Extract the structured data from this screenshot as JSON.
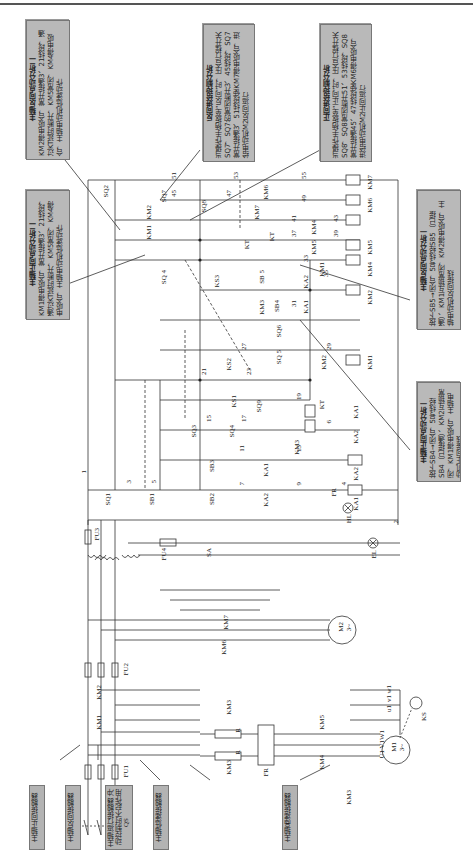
{
  "notes": {
    "n1": {
      "title": "主轴反向点动分析二",
      "body": "KM2得电吸合，常开接通3、21线段，通过KT延时断开，KM5常闭，KM4得电吸合，主轴电动机低速动作"
    },
    "n2": {
      "title": "反向进给控制分析",
      "body": "当操作手柄扳至“反向”时，压合行程开关SQ7，SQ7的常闭断开3、45线段，SQ7常开接通3、51线段使KM7得电吸合，进给电动机M2反向运行"
    },
    "n3": {
      "title": "正向进给控制分析",
      "body": "当操作手柄扳至“正向”时，压合行程开关SQ8，SQ8常闭断开51、53线段，SQ8常开接通45、47线段使KM6得电吸合，进给电动机M2正向运行"
    },
    "n4": {
      "title": "主轴正向点动分析二",
      "body": "KM1得电吸合，常开接通3、21线段，通过KT延时断开，KM5常闭，KM4得电吸合，主轴电动机低速动作"
    },
    "n5": {
      "title": "主轴反向点动分析一",
      "body": "按下SB5→闭合，5号线经SB5（已接通）、KM1互锁常闭，KM2得电吸合，主轴电动机反向接线"
    },
    "n6": {
      "title": "主轴正向点动分析一",
      "body": "按下SB4→闭合，5号线经SB4（已接通）、KM2互锁常闭，KM1得电吸合，主轴电动机正向接线"
    }
  },
  "tags": {
    "km1": "主轴正向接触器",
    "km2": "主轴反向接触器",
    "km3": "主轴运行接触器 冲动控制时不起作用",
    "km4": "主轴低速接触器",
    "km5": "主轴高速接触器"
  },
  "components": {
    "QS": "QS",
    "FU1": "FU1",
    "FU2": "FU2",
    "FU3": "FU3",
    "FU4": "FU4",
    "KM1": "KM1",
    "KM2": "KM2",
    "KM3a": "KM3",
    "KM3b": "KM3",
    "KM3c": "KM3",
    "KM4": "KM4",
    "KM5": "KM5",
    "KM6": "KM6",
    "KM7": "KM7",
    "FR": "FR",
    "R1": "R",
    "R2": "R",
    "M1": "M1",
    "M1sub": "3~",
    "M2": "M2",
    "M2sub": "3~",
    "KS": "KS",
    "U1": "U1",
    "V1": "V1",
    "W1": "W1",
    "u1": "u1",
    "v1": "v1",
    "w1": "w1",
    "SA": "SA",
    "EL": "EL",
    "HL": "HL",
    "SQ1": "SQ1",
    "SQ2": "SQ2",
    "SQ3": "SQ3",
    "SQ4": "SQ4",
    "SQ4b": "SQ 4",
    "SQ5": "SQ 5",
    "SQ6": "SQ6",
    "SQ7": "SQ7",
    "SQ8": "SQ8",
    "SQ9": "SQ9",
    "SB1": "SB1",
    "SB2": "SB2",
    "SB3": "SB3",
    "SB4": "SB4",
    "SB5": "SB 5",
    "KS1": "KS1",
    "KS2": "KS2",
    "KS3": "KS3",
    "KT": "KT",
    "KTb": "KT",
    "KTc": "KT",
    "KA1": "KA1",
    "KA2": "KA2",
    "c_KA1": "KA1",
    "c_KA2": "KA2",
    "c_KM1": "KM1",
    "c_KM2": "KM2",
    "c_KM3": "KM3",
    "c_KM4": "KM4",
    "c_KM5": "KM5",
    "c_KM6": "KM6",
    "c_KM7": "KM7",
    "i_KM1": "KM1",
    "i_KM2": "KM2",
    "i_KM3": "KM3",
    "i_KM4": "KM4",
    "i_KM5": "KM5",
    "i_KM6": "KM6",
    "i_KM7": "KM7",
    "i_KA1a": "KA1",
    "i_KA1b": "KA1",
    "i_KA2a": "KA2",
    "i_KA2b": "KA2"
  },
  "wires": {
    "w1": "1",
    "w2": "2",
    "w3": "3",
    "w4": "4",
    "w5": "5",
    "w6": "6",
    "w7": "7",
    "w9": "9",
    "w11": "11",
    "w13": "13",
    "w15": "15",
    "w17": "17",
    "w19": "19",
    "w21": "21",
    "w23": "23",
    "w27": "27",
    "w29": "29",
    "w31": "31",
    "w33": "33",
    "w35": "35",
    "w37": "37",
    "w39": "39",
    "w41": "41",
    "w43": "43",
    "w45": "45",
    "w47": "47",
    "w49": "49",
    "w51": "51",
    "w53": "53",
    "w55": "55"
  },
  "colors": {
    "note_bg": "#b9b9b9",
    "line": "#333333",
    "rule": "#555555"
  }
}
